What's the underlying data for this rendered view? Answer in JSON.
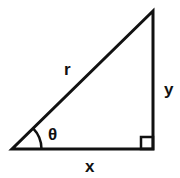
{
  "diagram": {
    "type": "right-triangle",
    "labels": {
      "hypotenuse": "r",
      "opposite": "y",
      "adjacent": "x",
      "angle": "θ"
    },
    "vertices": {
      "angle_vertex": [
        12,
        149
      ],
      "right_angle_vertex": [
        153,
        149
      ],
      "top_vertex": [
        153,
        11
      ]
    },
    "stroke_color": "#111111",
    "background": "#ffffff"
  }
}
